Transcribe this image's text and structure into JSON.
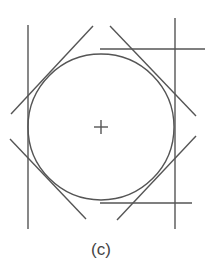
{
  "figure": {
    "caption": "(c)",
    "stroke_color": "#555555",
    "circle": {
      "cx": 101,
      "cy": 127,
      "r": 73
    },
    "center_mark": {
      "x": 101,
      "y": 127,
      "size": 7
    },
    "lines": [
      {
        "id": "left-vertical",
        "x1": 28,
        "y1": 25,
        "x2": 28,
        "y2": 229
      },
      {
        "id": "right-vertical",
        "x1": 175,
        "y1": 18,
        "x2": 175,
        "y2": 229
      },
      {
        "id": "top-horizontal",
        "x1": 100,
        "y1": 49,
        "x2": 205,
        "y2": 49
      },
      {
        "id": "bottom-horizontal",
        "x1": 100,
        "y1": 203,
        "x2": 192,
        "y2": 203
      },
      {
        "id": "top-left-diagonal",
        "x1": 11,
        "y1": 114,
        "x2": 93,
        "y2": 26
      },
      {
        "id": "top-right-diagonal",
        "x1": 110,
        "y1": 26,
        "x2": 196,
        "y2": 116
      },
      {
        "id": "bottom-left-diagonal",
        "x1": 10,
        "y1": 139,
        "x2": 86,
        "y2": 219
      },
      {
        "id": "bottom-right-diagonal",
        "x1": 117,
        "y1": 220,
        "x2": 196,
        "y2": 136
      }
    ]
  }
}
